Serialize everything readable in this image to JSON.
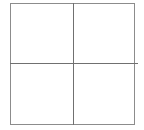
{
  "figure": {
    "title": "",
    "background_color": "#ffffff",
    "cell_fill_color": "#ffffff",
    "border_color": "#8c8c8c",
    "divider_color": "#707070",
    "border_width_px": 1,
    "columns": 2,
    "rows": 4,
    "cell_count": 4
  },
  "frame": {
    "left_px": 10,
    "top_px": 3,
    "width_px": 125,
    "height_px": 122
  },
  "dividers": {
    "vertical": {
      "label": "",
      "x_px": 73,
      "top_px": 3,
      "height_px": 122
    },
    "horizontal": {
      "label": "",
      "y_px": 63,
      "left_px": 10,
      "width_px": 128
    }
  },
  "cells": [
    {
      "label": "",
      "value": "",
      "position": "top-left"
    },
    {
      "label": "",
      "value": "",
      "position": "top-right"
    },
    {
      "label": "",
      "value": "",
      "position": "bottom-left"
    },
    {
      "label": "",
      "value": "",
      "position": "bottom-right"
    }
  ]
}
